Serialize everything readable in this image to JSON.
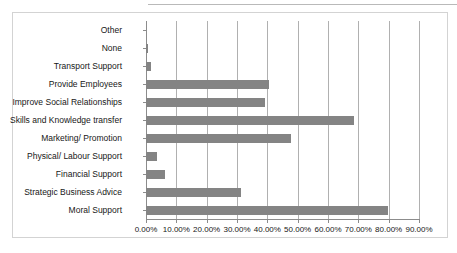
{
  "chart_data": {
    "type": "bar",
    "orientation": "horizontal",
    "title": "",
    "subtitle": "",
    "xlabel": "",
    "ylabel": "",
    "categories": [
      "Other",
      "None",
      "Transport Support",
      "Provide Employees",
      "Improve Social Relationships",
      "Skills and Knowledge transfer",
      "Marketing/ Promotion",
      "Physical/ Labour Support",
      "Financial Support",
      "Strategic Business Advice",
      "Moral Support"
    ],
    "values": [
      0,
      0.8,
      1.6,
      40.6,
      39.3,
      68.6,
      47.9,
      3.6,
      6.3,
      31.4,
      79.9
    ],
    "value_format": "percent",
    "xlim": [
      0,
      90
    ],
    "xticks": [
      0,
      10,
      20,
      30,
      40,
      50,
      60,
      70,
      80,
      90
    ],
    "xtick_labels": [
      "0.00%",
      "10.00%",
      "20.00%",
      "30.00%",
      "40.00%",
      "50.00%",
      "60.00%",
      "70.00%",
      "80.00%",
      "90.00%"
    ],
    "grid": "vertical",
    "legend": "none",
    "series_color": "#848484",
    "gridline_color": "#b0b0b0",
    "axis_color": "#8c8c8c",
    "plot_background": "#ffffff",
    "border_color": "#d3d3d3"
  }
}
